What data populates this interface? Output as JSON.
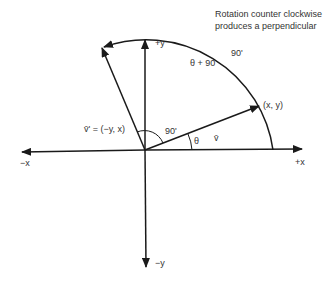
{
  "annotation": {
    "line1": "Rotation counter clockwise",
    "line2": "produces a perpendicular"
  },
  "axes": {
    "pos_x": "+x",
    "neg_x": "−x",
    "pos_y": "+y",
    "neg_y": "−y"
  },
  "labels": {
    "vector_v": "v̄",
    "point_v": "(x, y)",
    "vector_perp": "v̄' = (−y, x)",
    "theta": "θ",
    "theta_plus_90": "θ + 90",
    "right_angle": "90'",
    "arc_angle": "90'"
  },
  "colors": {
    "line": "#1a1a1a",
    "text": "#333333"
  }
}
